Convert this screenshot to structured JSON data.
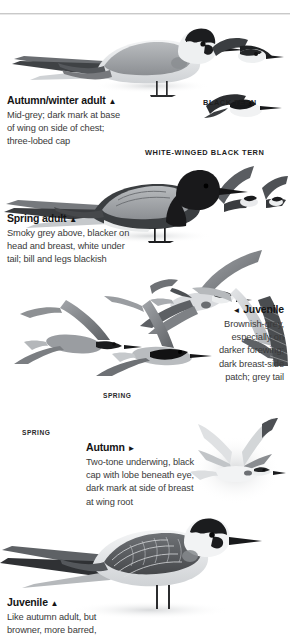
{
  "page": {
    "width": 290,
    "height": 637,
    "background": "#ffffff"
  },
  "divider": {
    "name": "top-horizontal-rule",
    "color": "#c9c9c9"
  },
  "species_labels": [
    {
      "id": "black-tern",
      "text": "BLACK TERN"
    },
    {
      "id": "white-winged-black-tern",
      "text": "WHITE-WINGED BLACK TERN"
    }
  ],
  "plate_labels": [
    {
      "id": "spring-left",
      "text": "SPRING"
    },
    {
      "id": "spring-centre",
      "text": "SPRING"
    }
  ],
  "captions": {
    "autumn_winter_adult": {
      "heading": "Autumn/winter adult",
      "marker": "▲",
      "marker_name": "triangle-up",
      "lines": [
        "Mid-grey; dark mark at base",
        "of wing on side of chest;",
        "three-lobed cap"
      ]
    },
    "spring_adult": {
      "heading": "Spring adult",
      "marker": "▲",
      "marker_name": "triangle-up",
      "lines": [
        "Smoky grey above, blacker on",
        "head and breast, white under",
        "tail; bill and legs blackish"
      ]
    },
    "juvenile_right": {
      "heading": "Juvenile",
      "marker": "◄",
      "marker_name": "triangle-left",
      "lines": [
        "Brownish-grey,",
        "especially on",
        "darker forewing;",
        "dark breast-side",
        "patch; grey tail"
      ]
    },
    "autumn": {
      "heading": "Autumn",
      "marker": "►",
      "marker_name": "triangle-right",
      "lines": [
        "Two-tone underwing, black",
        "cap with lobe beneath eye,",
        "dark mark at side of breast",
        "at wing root"
      ]
    },
    "juvenile_bottom": {
      "heading": "Juvenile",
      "marker": "▲",
      "marker_name": "triangle-up",
      "lines": [
        "Like autumn adult, but",
        "browner, more barred,"
      ]
    }
  },
  "colors": {
    "ink": "#2b2b2b",
    "heading": "#141414",
    "body": "#3a3a3a",
    "rule": "#c9c9c9",
    "plumage_dark": "#2a2a2c",
    "plumage_mid": "#8e9093",
    "plumage_light": "#d8dadc",
    "plumage_pale": "#f1f2f3"
  }
}
